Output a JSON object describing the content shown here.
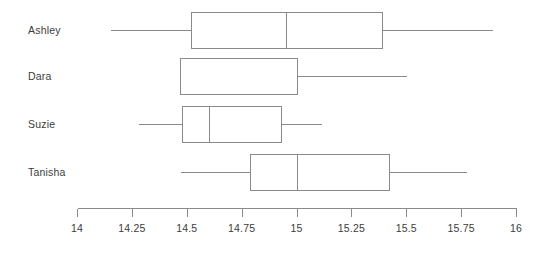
{
  "chart_data": {
    "type": "box",
    "title": "",
    "xlabel": "",
    "ylabel": "",
    "orientation": "horizontal",
    "xlim": [
      14,
      16
    ],
    "grid": false,
    "legend": false,
    "categories": [
      "Ashley",
      "Dara",
      "Suzie",
      "Tanisha"
    ],
    "tick_values": [
      14,
      14.25,
      14.5,
      14.75,
      15,
      15.25,
      15.5,
      15.75,
      16
    ],
    "tick_labels": [
      "14",
      "14.25",
      "14.5",
      "14.75",
      "15",
      "15.25",
      "15.5",
      "15.75",
      "16"
    ],
    "boxes": [
      {
        "label": "Ashley",
        "min": 14.15,
        "q1": 14.52,
        "median": 14.95,
        "q3": 15.39,
        "max": 15.89,
        "has_median_line": true,
        "has_left_whisker": true,
        "has_right_whisker": true
      },
      {
        "label": "Dara",
        "min": 14.47,
        "q1": 14.47,
        "median": 14.47,
        "q3": 15.0,
        "max": 15.5,
        "has_median_line": false,
        "has_left_whisker": false,
        "has_right_whisker": true
      },
      {
        "label": "Suzie",
        "min": 14.28,
        "q1": 14.48,
        "median": 14.6,
        "q3": 14.93,
        "max": 15.11,
        "has_median_line": true,
        "has_left_whisker": true,
        "has_right_whisker": true
      },
      {
        "label": "Tanisha",
        "min": 14.47,
        "q1": 14.79,
        "median": 15.0,
        "q3": 15.42,
        "max": 15.77,
        "has_median_line": true,
        "has_left_whisker": true,
        "has_right_whisker": true
      }
    ],
    "colors": {
      "line": "#8a8a8a",
      "text": "#3c3c3c",
      "background": "#ffffff",
      "box_fill": "#ffffff"
    }
  },
  "layout": {
    "plot_left_px": 77,
    "plot_right_px": 516,
    "axis_y_px": 208,
    "tick_len_px": 8,
    "row_centers_px": [
      30,
      76,
      124,
      172
    ],
    "box_half_height_px": 18
  }
}
